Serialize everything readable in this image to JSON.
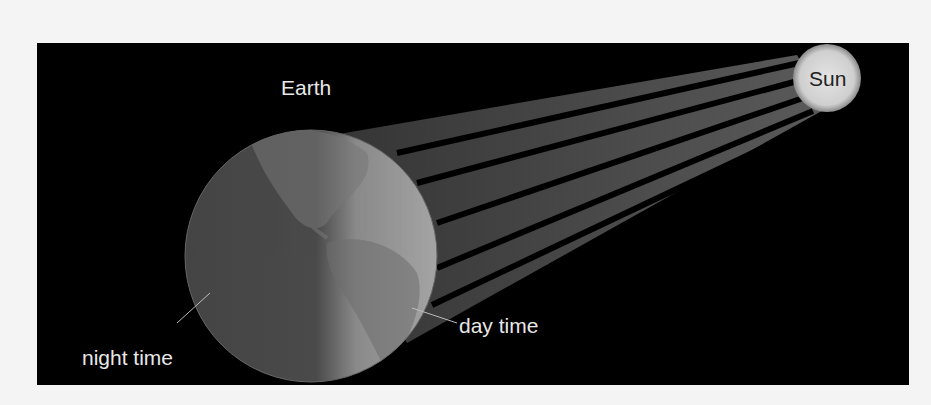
{
  "diagram": {
    "type": "illustration",
    "labels": {
      "earth": "Earth",
      "sun": "Sun",
      "day": "day time",
      "night": "night time"
    },
    "colors": {
      "background": "#000000",
      "frame": "#f4f4f4",
      "earth_day": "#9a9a9a",
      "earth_night": "#4a4a4a",
      "sun": "#d8d8d8",
      "rays": "#4d4d4d",
      "text": "#e8e8e8"
    },
    "rays_count": 5
  }
}
